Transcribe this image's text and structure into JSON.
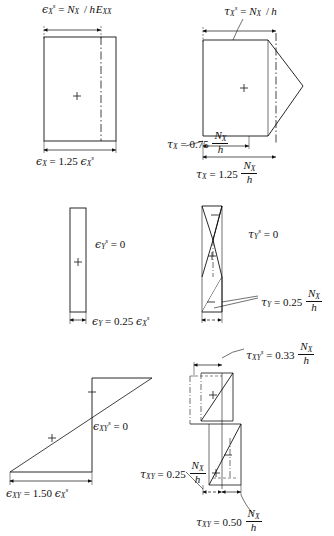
{
  "figure": {
    "background": "#ffffff",
    "line_color": "#111111",
    "panels": [
      {
        "id": "top-left",
        "quantity": "strain-x",
        "top_label": {
          "symbol": "ϵ",
          "sub": "X",
          "sup": "s",
          "eq": "=",
          "rhs_num": "N",
          "rhs_num_sub": "X",
          "rhs_den": "h E",
          "rhs_den_sub": "XX",
          "full": "ϵXs = NX / hEXX"
        },
        "bottom_label": {
          "symbol": "ϵ",
          "sub": "X",
          "eq": "=",
          "coefficient": "1.25",
          "reference": "ϵXs",
          "full": "ϵX = 1.25 ϵXs"
        },
        "shape": "rectangle",
        "sign_markers": [
          "+"
        ],
        "has_centerline": true
      },
      {
        "id": "top-right",
        "quantity": "shear-x",
        "top_label": {
          "symbol": "τ",
          "sub": "X",
          "sup": "s",
          "eq": "=",
          "rhs_num": "N",
          "rhs_num_sub": "X",
          "rhs_den": "h",
          "full": "τXs = NX / h"
        },
        "mid_label": {
          "symbol": "τ",
          "sub": "X",
          "eq": "=",
          "coefficient": "0.75",
          "num": "N",
          "num_sub": "X",
          "den": "h",
          "full": "τX = 0.75 NX/h"
        },
        "bottom_label": {
          "symbol": "τ",
          "sub": "X",
          "eq": "=",
          "coefficient": "1.25",
          "num": "N",
          "num_sub": "X",
          "den": "h",
          "full": "τX = 1.25 NX/h"
        },
        "shape": "hexagon-peak-right",
        "sign_markers": [
          "+"
        ],
        "has_centerline": true
      },
      {
        "id": "middle-left",
        "quantity": "strain-y",
        "side_label": {
          "symbol": "ϵ",
          "sub": "Y",
          "sup": "s",
          "eq": "=",
          "value": "0",
          "full": "ϵYs = 0"
        },
        "bottom_label": {
          "symbol": "ϵ",
          "sub": "Y",
          "eq": "=",
          "coefficient": "0.25",
          "reference": "ϵXs",
          "full": "ϵY = 0.25 ϵXs"
        },
        "shape": "narrow-rectangle",
        "sign_markers": [
          "+"
        ],
        "has_centerline": false
      },
      {
        "id": "middle-right",
        "quantity": "shear-y",
        "side_label": {
          "symbol": "τ",
          "sub": "Y",
          "sup": "s",
          "eq": "=",
          "value": "0",
          "full": "τYs = 0"
        },
        "lower_label": {
          "symbol": "τ",
          "sub": "Y",
          "eq": "=",
          "coefficient": "0.25",
          "num": "N",
          "num_sub": "X",
          "den": "h",
          "full": "τY = 0.25 NX/h"
        },
        "shape": "s-curve-zigzag",
        "sign_markers": [
          "−",
          "+",
          "−"
        ],
        "has_centerline": true
      },
      {
        "id": "bottom-left",
        "quantity": "strain-xy",
        "side_label": {
          "symbol": "ϵ",
          "sub": "XY",
          "sup": "s",
          "eq": "=",
          "value": "0",
          "full": "ϵXYs = 0"
        },
        "bottom_label": {
          "symbol": "ϵ",
          "sub": "XY",
          "eq": "=",
          "coefficient": "1.50",
          "reference": "ϵXs",
          "full": "ϵXY = 1.50 ϵXs"
        },
        "shape": "z-step-diagonal",
        "sign_markers": [
          "−",
          "+"
        ],
        "has_centerline": false
      },
      {
        "id": "bottom-right",
        "quantity": "shear-xy",
        "top_label": {
          "symbol": "τ",
          "sub": "XY",
          "sup": "s",
          "eq": "=",
          "coefficient": "0.33",
          "num": "N",
          "num_sub": "X",
          "den": "h",
          "full": "τXYs = 0.33 NX/h"
        },
        "left_label": {
          "symbol": "τ",
          "sub": "XY",
          "eq": "=",
          "coefficient": "0.25",
          "num": "N",
          "num_sub": "X",
          "den": "h",
          "full": "τXY = 0.25 NX/h"
        },
        "bottom_label": {
          "symbol": "τ",
          "sub": "XY",
          "eq": "=",
          "coefficient": "0.50",
          "num": "N",
          "num_sub": "X",
          "den": "h",
          "full": "τXY = 0.50 NX/h"
        },
        "shape": "double-z-step",
        "sign_markers": [
          "+",
          "−",
          "+"
        ],
        "has_centerline": true
      }
    ],
    "glyphs": {
      "plus": "+",
      "minus": "−",
      "epsilon": "ϵ",
      "tau": "τ"
    }
  }
}
